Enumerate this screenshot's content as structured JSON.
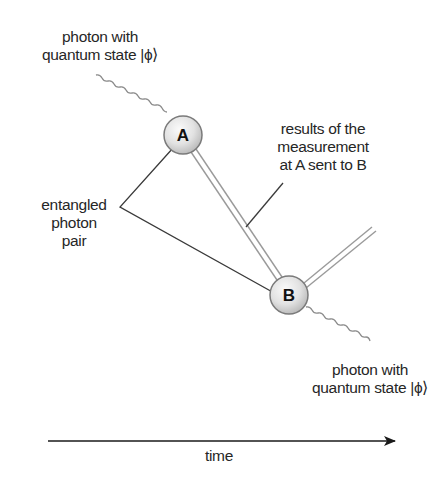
{
  "diagram": {
    "type": "quantum-teleportation-schematic",
    "labels": {
      "photon_in": [
        "photon with",
        "quantum state |ϕ⟩"
      ],
      "results": [
        "results of the",
        "measurement",
        "at A sent to B"
      ],
      "entangled": [
        "entangled",
        "photon",
        "pair"
      ],
      "photon_out": [
        "photon with",
        "quantum state |ϕ⟩"
      ],
      "time_axis": "time"
    },
    "nodes": [
      {
        "id": "A",
        "label": "A",
        "cx": 183,
        "cy": 135,
        "r": 19
      },
      {
        "id": "B",
        "label": "B",
        "cx": 289,
        "cy": 295,
        "r": 19
      }
    ],
    "edges": [
      {
        "from": "photon_in",
        "to": "A",
        "style": "wavy"
      },
      {
        "from": "A",
        "to": "B",
        "style": "double-line",
        "meaning": "classical channel"
      },
      {
        "from": "B",
        "to": "off-right",
        "style": "double-line"
      },
      {
        "from": "B",
        "to": "photon_out",
        "style": "wavy"
      },
      {
        "from": "entangled_label",
        "to": "A",
        "style": "pointer"
      },
      {
        "from": "entangled_label",
        "to": "B",
        "style": "pointer"
      },
      {
        "from": "results_label",
        "to": "A-B channel",
        "style": "pointer"
      }
    ],
    "colors": {
      "text": "#262626",
      "node_fill_light": "#f4f4f4",
      "node_fill_dark": "#bdbdbd",
      "node_stroke": "#7a7a7a",
      "double_line": "#9a9a9a",
      "wavy": "#8c8c8c",
      "pointer": "#3a3a3a",
      "arrow": "#1a1a1a"
    }
  }
}
